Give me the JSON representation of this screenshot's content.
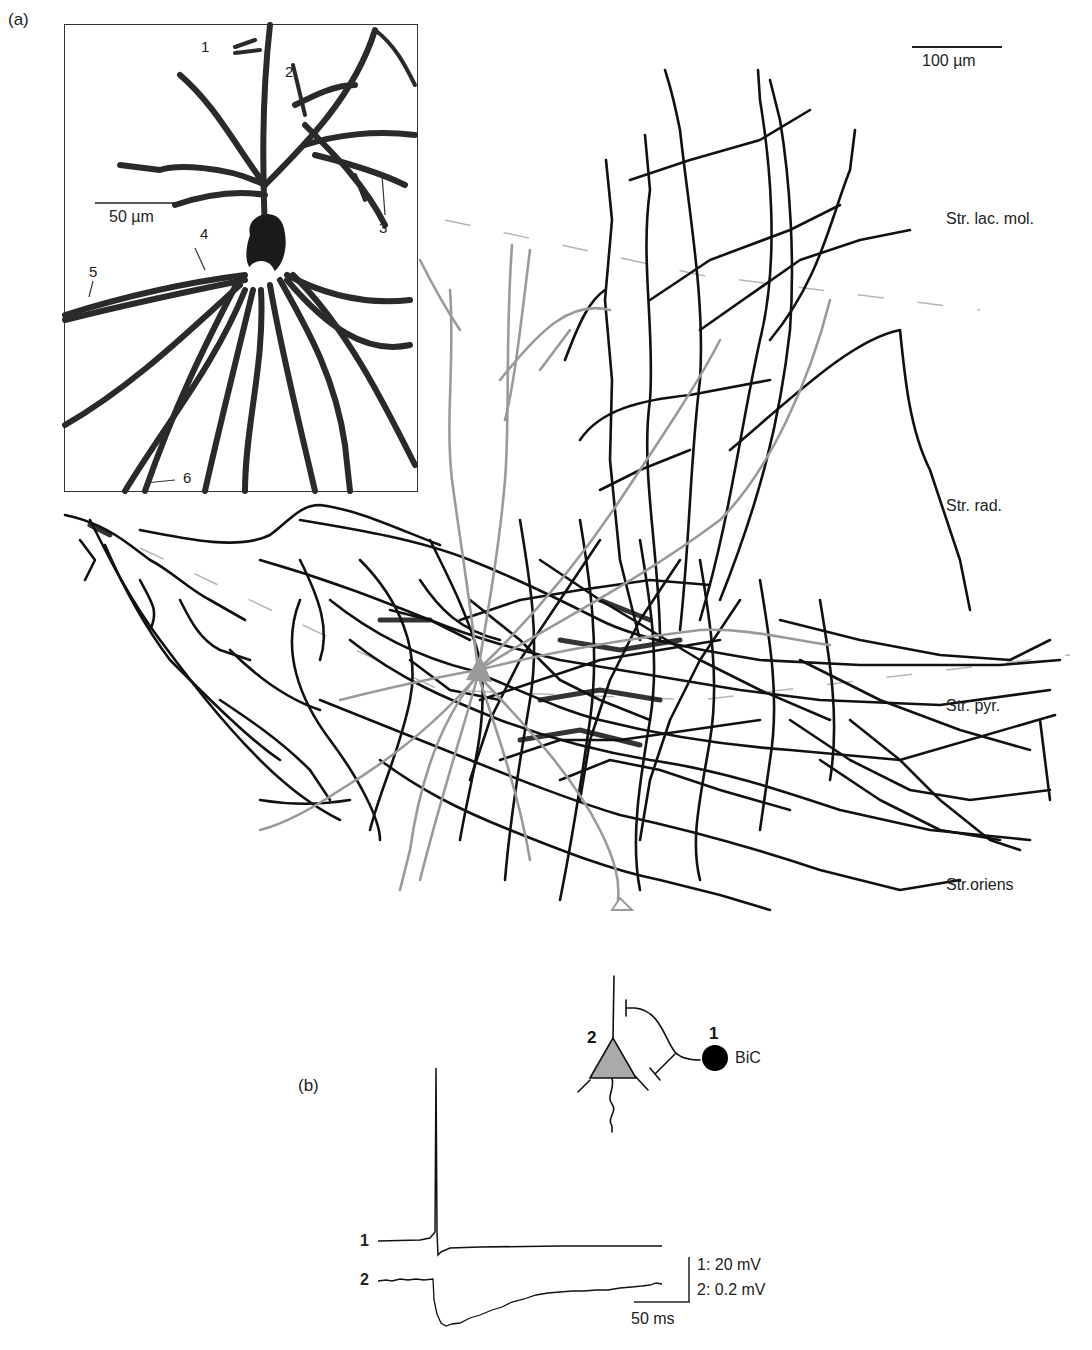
{
  "figure": {
    "panel_a": {
      "label": "(a)",
      "inset": {
        "scale_bar": "50 µm",
        "markers": [
          "1",
          "2",
          "3",
          "4",
          "5",
          "6"
        ]
      },
      "scale_bar": "100 µm",
      "layers": [
        {
          "name": "Str. lac. mol."
        },
        {
          "name": "Str. rad."
        },
        {
          "name": "Str. pyr."
        },
        {
          "name": "Str.oriens"
        }
      ],
      "colors": {
        "axon": "#111111",
        "pyramidal_dendrite": "#9a9a9a",
        "layer_boundary": "#b5b5b5",
        "inset_border": "#333333"
      }
    },
    "panel_b": {
      "label": "(b)",
      "diagram": {
        "pyramidal_label": "2",
        "interneuron_label": "1",
        "interneuron_name": "BiC",
        "pyramidal_fill": "#aaaaaa",
        "interneuron_fill": "#000000"
      },
      "traces": [
        {
          "id": "1",
          "label": "1",
          "description": "presynaptic action potential"
        },
        {
          "id": "2",
          "label": "2",
          "description": "postsynaptic IPSP"
        }
      ],
      "scale": {
        "voltage_1": "1: 20 mV",
        "voltage_2": "2: 0.2 mV",
        "time": "50 ms"
      }
    }
  }
}
